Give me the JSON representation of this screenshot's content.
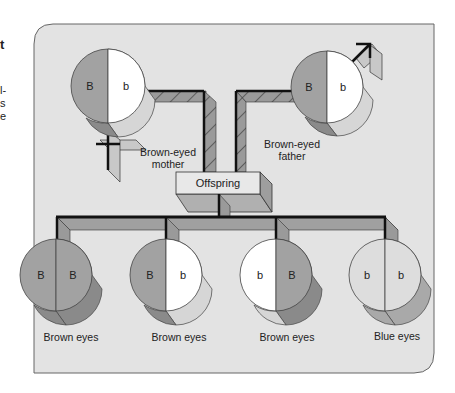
{
  "figure": {
    "caption_fragment": [
      "t",
      "l-",
      "s",
      "e"
    ],
    "colors": {
      "panel": "#e3e3e3",
      "panel_border": "#555555",
      "brown_allele": "#a2a2a2",
      "brown_shadow": "#8a8a8a",
      "white_allele": "#ffffff",
      "white_shadow": "#d6d6d6",
      "blue_allele": "#dddddd",
      "blue_shadow": "#a9a9a9",
      "connector": "#9a9a9a",
      "line": "#111111"
    },
    "parents": [
      {
        "label_line1": "Brown-eyed",
        "label_line2": "mother",
        "left_allele": "B",
        "right_allele": "b",
        "symbol": "female"
      },
      {
        "label_line1": "Brown-eyed",
        "label_line2": "father",
        "left_allele": "B",
        "right_allele": "b",
        "symbol": "male"
      }
    ],
    "center_box": {
      "label": "Offspring"
    },
    "offspring": [
      {
        "left_allele": "B",
        "right_allele": "B",
        "phenotype": "Brown eyes"
      },
      {
        "left_allele": "B",
        "right_allele": "b",
        "phenotype": "Brown eyes"
      },
      {
        "left_allele": "b",
        "right_allele": "B",
        "phenotype": "Brown eyes"
      },
      {
        "left_allele": "b",
        "right_allele": "b",
        "phenotype": "Blue eyes"
      }
    ]
  }
}
